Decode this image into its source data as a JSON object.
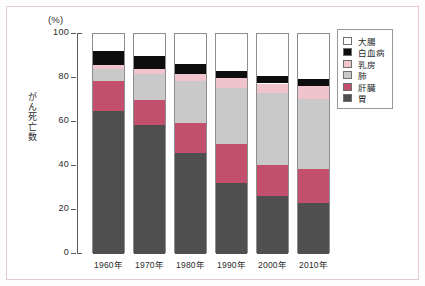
{
  "chart_data": {
    "type": "bar",
    "subtype": "stacked-100-percent",
    "title": "",
    "xlabel": "",
    "ylabel": "がん死亡数",
    "yunit": "(%)",
    "ylim": [
      0,
      100
    ],
    "yticks": [
      100,
      80,
      60,
      40,
      20,
      0
    ],
    "ytick_labels": [
      "100",
      "80",
      "60",
      "40",
      "20",
      "0"
    ],
    "grid": false,
    "legend_position": "right",
    "categories": [
      "1960年",
      "1970年",
      "1980年",
      "1990年",
      "2000年",
      "2010年"
    ],
    "series": [
      {
        "name": "胃",
        "color": "#4f4f4f",
        "values": [
          65.0,
          58.5,
          46.0,
          32.5,
          26.5,
          23.0
        ]
      },
      {
        "name": "肝臓",
        "color": "#c2506d",
        "values": [
          13.5,
          11.5,
          13.5,
          17.5,
          14.0,
          15.5
        ]
      },
      {
        "name": "肺",
        "color": "#c9c9c9",
        "values": [
          5.5,
          12.0,
          19.0,
          25.5,
          32.5,
          32.0
        ]
      },
      {
        "name": "乳房",
        "color": "#f0c4cd",
        "values": [
          2.0,
          2.0,
          3.5,
          4.5,
          4.5,
          6.0
        ]
      },
      {
        "name": "白血病",
        "color": "#0d0d0d",
        "values": [
          6.5,
          6.0,
          4.5,
          3.0,
          3.5,
          3.0
        ]
      },
      {
        "name": "大腸",
        "color": "#ffffff",
        "values": [
          7.5,
          10.0,
          13.5,
          17.0,
          19.0,
          20.5
        ]
      }
    ],
    "cumulative_tops": {
      "1960年": {
        "胃": 65.0,
        "肝臓": 78.5,
        "肺": 84.0,
        "乳房": 86.0,
        "白血病": 92.5,
        "大腸": 100
      },
      "1970年": {
        "胃": 58.5,
        "肝臓": 70.0,
        "肺": 82.0,
        "乳房": 84.0,
        "白血病": 90.0,
        "大腸": 100
      },
      "1980年": {
        "胃": 46.0,
        "肝臓": 59.5,
        "肺": 78.5,
        "乳房": 82.0,
        "白血病": 86.5,
        "大腸": 100
      },
      "1990年": {
        "胃": 32.5,
        "肝臓": 50.0,
        "肺": 75.5,
        "乳房": 80.0,
        "白血病": 83.0,
        "大腸": 100
      },
      "2000年": {
        "胃": 26.5,
        "肝臓": 40.5,
        "肺": 73.0,
        "乳房": 77.5,
        "白血病": 81.0,
        "大腸": 100
      },
      "2010年": {
        "胃": 23.0,
        "肝臓": 38.5,
        "肺": 70.5,
        "乳房": 76.5,
        "白血病": 79.5,
        "大腸": 100
      }
    }
  },
  "legend": {
    "items": [
      {
        "label": "大腸",
        "color": "#ffffff"
      },
      {
        "label": "白血病",
        "color": "#0d0d0d"
      },
      {
        "label": "乳房",
        "color": "#f0c4cd"
      },
      {
        "label": "肺",
        "color": "#c9c9c9"
      },
      {
        "label": "肝臓",
        "color": "#c2506d"
      },
      {
        "label": "胃",
        "color": "#4f4f4f"
      }
    ]
  },
  "axis": {
    "unit_label": "(%)",
    "y_title": "がん死亡数",
    "ticks": [
      "100",
      "80",
      "60",
      "40",
      "20",
      "0"
    ],
    "x_labels": [
      "1960年",
      "1970年",
      "1980年",
      "1990年",
      "2000年",
      "2010年"
    ]
  }
}
